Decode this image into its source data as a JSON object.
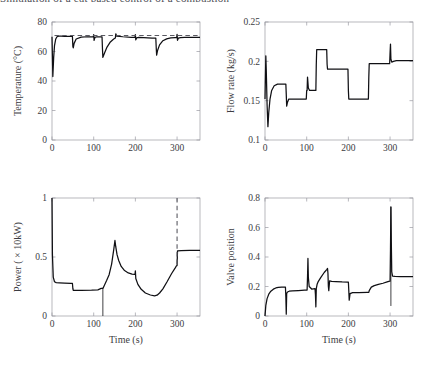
{
  "figure": {
    "clipped_header": "Simulation of a cut based control of a combustion",
    "x_axis_label": "Time (s)"
  },
  "chart_data": [
    {
      "type": "line",
      "title": "",
      "panel": "top-left",
      "xlabel": "",
      "ylabel": "Temperature (°C)",
      "xlim": [
        0,
        355
      ],
      "ylim": [
        0,
        80
      ],
      "xticks": [
        0,
        100,
        200,
        300
      ],
      "yticks": [
        0,
        20,
        40,
        60,
        80
      ],
      "grid": false,
      "series": [
        {
          "name": "Temperature",
          "style": "solid",
          "x": [
            0,
            2,
            4,
            6,
            9,
            12,
            16,
            22,
            30,
            40,
            49,
            50,
            51,
            53,
            58,
            70,
            85,
            99,
            100,
            101,
            103,
            108,
            118,
            120,
            121,
            122,
            126,
            132,
            140,
            148,
            152,
            153,
            155,
            170,
            190,
            199,
            200,
            201,
            203,
            208,
            220,
            240,
            249,
            250,
            251,
            253,
            258,
            266,
            275,
            285,
            295,
            299,
            300,
            301,
            303,
            308,
            318,
            335,
            355
          ],
          "y": [
            70,
            43,
            56,
            64,
            68.5,
            70,
            70.4,
            70.4,
            70.3,
            70.2,
            70.2,
            63.5,
            62.4,
            65.5,
            68.5,
            69.8,
            70,
            70,
            71.5,
            67.5,
            69.6,
            70,
            70,
            70,
            62,
            56,
            59,
            63,
            66.5,
            68.5,
            69.2,
            72,
            70.5,
            70,
            69.6,
            69.5,
            71.4,
            67.9,
            69.2,
            69.6,
            69.4,
            69.1,
            69,
            62.5,
            57.5,
            60.5,
            64.5,
            67.3,
            68.6,
            69.2,
            69.4,
            69.4,
            71.6,
            67.6,
            69,
            69.4,
            69.5,
            69.6,
            69.6
          ]
        },
        {
          "name": "Setpoint",
          "style": "dashed",
          "x": [
            6,
            355
          ],
          "y": [
            70.8,
            70.8
          ]
        }
      ]
    },
    {
      "type": "line",
      "panel": "top-right",
      "xlabel": "",
      "ylabel": "Flow rate (kg/s)",
      "xlim": [
        0,
        355
      ],
      "ylim": [
        0.1,
        0.25
      ],
      "xticks": [
        0,
        100,
        200,
        300
      ],
      "yticks": [
        0.1,
        0.15,
        0.2,
        0.25
      ],
      "grid": false,
      "series": [
        {
          "name": "Flow rate",
          "style": "solid",
          "x": [
            0,
            2,
            3,
            5,
            7,
            9,
            12,
            16,
            22,
            30,
            40,
            50,
            51,
            52,
            54,
            57,
            62,
            70,
            85,
            99,
            100,
            101,
            102,
            104,
            107,
            112,
            118,
            122,
            123,
            124,
            148,
            149,
            150,
            199,
            200,
            201,
            248,
            249,
            250,
            299,
            300,
            301,
            302,
            304,
            308,
            315,
            330,
            355
          ],
          "y": [
            0.152,
            0.207,
            0.19,
            0.145,
            0.117,
            0.135,
            0.152,
            0.163,
            0.169,
            0.171,
            0.171,
            0.171,
            0.158,
            0.143,
            0.148,
            0.152,
            0.152,
            0.152,
            0.152,
            0.152,
            0.163,
            0.163,
            0.18,
            0.166,
            0.163,
            0.163,
            0.163,
            0.163,
            0.196,
            0.215,
            0.215,
            0.196,
            0.19,
            0.19,
            0.163,
            0.152,
            0.152,
            0.18,
            0.197,
            0.197,
            0.211,
            0.222,
            0.203,
            0.199,
            0.2,
            0.201,
            0.201,
            0.201
          ]
        }
      ]
    },
    {
      "type": "line",
      "panel": "bottom-left",
      "xlabel": "Time (s)",
      "ylabel": "Power ( × 10kW)",
      "xlim": [
        0,
        355
      ],
      "ylim": [
        0,
        1
      ],
      "xticks": [
        0,
        100,
        200,
        300
      ],
      "yticks": [
        0,
        0.5,
        1
      ],
      "grid": false,
      "series": [
        {
          "name": "Power",
          "style": "solid",
          "x": [
            0,
            1,
            3,
            6,
            10,
            18,
            30,
            45,
            49,
            50,
            51,
            70,
            95,
            110,
            118,
            119,
            120,
            121,
            122,
            123,
            126,
            131,
            137,
            143,
            148,
            151,
            153,
            156,
            160,
            166,
            174,
            183,
            192,
            199,
            200,
            201,
            206,
            214,
            224,
            236,
            246,
            252,
            258,
            266,
            276,
            287,
            296,
            299,
            300,
            301,
            310,
            330,
            355
          ],
          "y": [
            1,
            0.52,
            0.33,
            0.29,
            0.283,
            0.281,
            0.279,
            0.277,
            0.276,
            0.233,
            0.218,
            0.218,
            0.219,
            0.222,
            0.234,
            0.234,
            0.234,
            0.234,
            0.234,
            0.24,
            0.262,
            0.3,
            0.35,
            0.44,
            0.56,
            0.64,
            0.585,
            0.52,
            0.47,
            0.42,
            0.385,
            0.365,
            0.355,
            0.352,
            0.382,
            0.318,
            0.268,
            0.226,
            0.195,
            0.178,
            0.171,
            0.176,
            0.195,
            0.23,
            0.29,
            0.36,
            0.41,
            0.428,
            0.428,
            0.552,
            0.554,
            0.556,
            0.556
          ]
        },
        {
          "name": "shutdown-drop",
          "style": "vertical-thin",
          "x": [
            122,
            122
          ],
          "y": [
            0.234,
            0
          ]
        },
        {
          "name": "event-marker",
          "style": "dashed-vertical",
          "x": [
            300,
            300
          ],
          "y": [
            0.44,
            1.0
          ]
        }
      ]
    },
    {
      "type": "line",
      "panel": "bottom-right",
      "xlabel": "Time (s)",
      "ylabel": "Valve position",
      "xlim": [
        0,
        355
      ],
      "ylim": [
        0,
        0.8
      ],
      "xticks": [
        0,
        100,
        200,
        300
      ],
      "yticks": [
        0,
        0.2,
        0.4,
        0.6,
        0.8
      ],
      "grid": false,
      "series": [
        {
          "name": "Valve position",
          "style": "solid",
          "x": [
            0,
            2,
            5,
            9,
            14,
            20,
            26,
            32,
            40,
            49,
            50,
            51,
            52,
            54,
            58,
            66,
            80,
            95,
            101,
            102,
            103,
            104,
            106,
            112,
            120,
            121,
            122,
            123,
            125,
            128,
            134,
            142,
            148,
            150,
            151,
            152,
            153,
            155,
            160,
            170,
            185,
            199,
            200,
            201,
            202,
            204,
            210,
            225,
            245,
            249,
            250,
            255,
            262,
            272,
            283,
            293,
            299,
            300,
            301,
            302,
            303,
            304,
            306,
            312,
            325,
            340,
            355
          ],
          "y": [
            0,
            0.072,
            0.118,
            0.148,
            0.168,
            0.182,
            0.19,
            0.194,
            0.196,
            0.196,
            0.13,
            0.012,
            0.152,
            0.163,
            0.168,
            0.17,
            0.172,
            0.175,
            0.176,
            0.265,
            0.39,
            0.26,
            0.2,
            0.183,
            0.185,
            0.145,
            0.062,
            0.185,
            0.215,
            0.235,
            0.262,
            0.295,
            0.315,
            0.322,
            0.29,
            0.2,
            0.172,
            0.238,
            0.235,
            0.233,
            0.231,
            0.23,
            0.23,
            0.172,
            0.107,
            0.152,
            0.158,
            0.159,
            0.16,
            0.16,
            0.172,
            0.196,
            0.206,
            0.215,
            0.222,
            0.231,
            0.236,
            0.236,
            0.45,
            0.74,
            0.5,
            0.3,
            0.27,
            0.268,
            0.267,
            0.267,
            0.267
          ]
        },
        {
          "name": "spike-down",
          "style": "vertical-thin",
          "x": [
            302,
            302
          ],
          "y": [
            0.74,
            0.068
          ]
        }
      ]
    }
  ]
}
